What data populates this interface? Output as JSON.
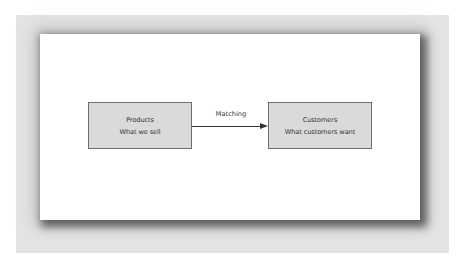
{
  "diagram": {
    "nodes": [
      {
        "id": "products",
        "title": "Products",
        "subtitle": "What we sell"
      },
      {
        "id": "customers",
        "title": "Customers",
        "subtitle": "What customers want"
      }
    ],
    "edges": [
      {
        "from": "products",
        "to": "customers",
        "label": "Matching"
      }
    ]
  },
  "colors": {
    "box_fill": "#dadada",
    "box_border": "#6e6e6e",
    "text": "#333333",
    "backdrop": "#e4e4e4"
  }
}
